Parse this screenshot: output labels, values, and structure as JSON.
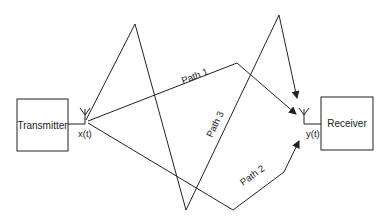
{
  "diagram": {
    "transmitter": {
      "label": "Transmitter",
      "signal": "x(t)"
    },
    "receiver": {
      "label": "Receiver",
      "signal": "y(t)"
    },
    "paths": [
      {
        "label": "Path 1"
      },
      {
        "label": "Path 2"
      },
      {
        "label": "Path 3"
      }
    ],
    "colors": {
      "line": "#222222",
      "background": "#ffffff"
    }
  }
}
